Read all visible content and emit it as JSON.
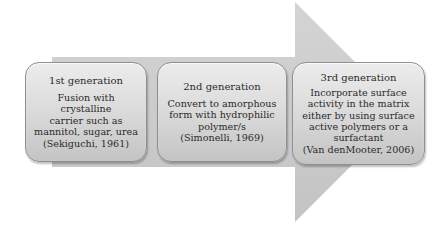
{
  "diagram": {
    "type": "process-arrow",
    "arrow_color": "#c8c8c8",
    "box_color": "#d6d6d6",
    "generations": [
      {
        "title": "1st generation",
        "body": "Fusion with crystalline\ncarrier such as\nmannitol, sugar, urea\n(Sekiguchi, 1961)"
      },
      {
        "title": "2nd generation",
        "body": "Convert to amorphous\nform with hydrophilic\npolymer/s\n(Simonelli, 1969)"
      },
      {
        "title": "3rd generation",
        "body": "Incorporate surface\nactivity in the matrix\neither by using surface\nactive polymers or a\nsurfactant\n(Van denMooter, 2006)"
      }
    ]
  }
}
